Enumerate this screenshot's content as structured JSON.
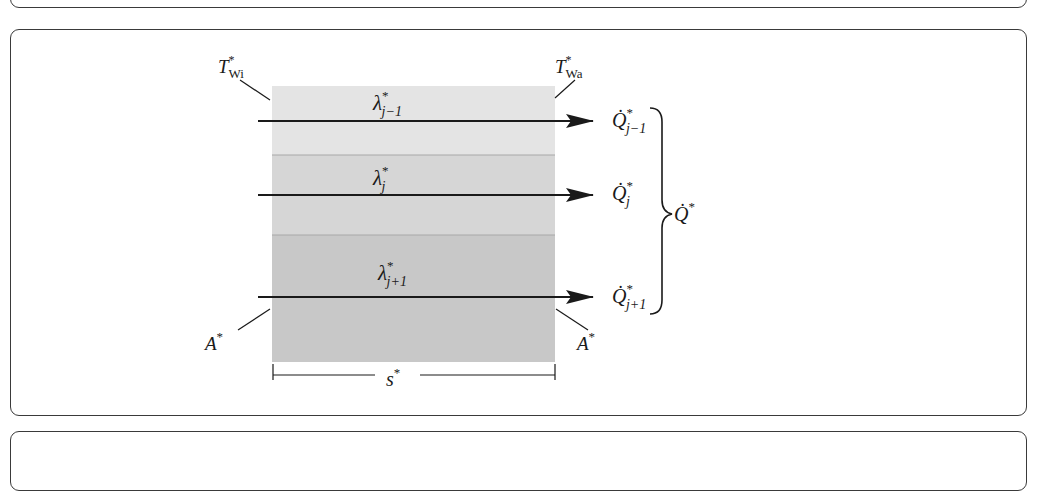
{
  "figure": {
    "colors": {
      "layer_top": "#e4e4e4",
      "layer_middle": "#d6d6d6",
      "layer_bottom": "#c8c8c8",
      "stroke": "#1a1a1a",
      "frame": "#3a3a3a"
    },
    "labels": {
      "t_inner": {
        "base": "T",
        "sup": "*",
        "sub": "Wi"
      },
      "t_outer": {
        "base": "T",
        "sup": "*",
        "sub": "Wa"
      },
      "area_left": {
        "base": "A",
        "sup": "*"
      },
      "area_right": {
        "base": "A",
        "sup": "*"
      },
      "thickness": {
        "base": "s",
        "sup": "*"
      },
      "q_total": {
        "base": "Q̇",
        "sup": "*"
      }
    },
    "layers": [
      {
        "lambda": {
          "base": "λ",
          "sup": "*",
          "sub": "j−1"
        },
        "q": {
          "base": "Q̇",
          "sup": "*",
          "sub": "j−1"
        }
      },
      {
        "lambda": {
          "base": "λ",
          "sup": "*",
          "sub": "j"
        },
        "q": {
          "base": "Q̇",
          "sup": "*",
          "sub": "j"
        }
      },
      {
        "lambda": {
          "base": "λ",
          "sup": "*",
          "sub": "j+1"
        },
        "q": {
          "base": "Q̇",
          "sup": "*",
          "sub": "j+1"
        }
      }
    ]
  }
}
